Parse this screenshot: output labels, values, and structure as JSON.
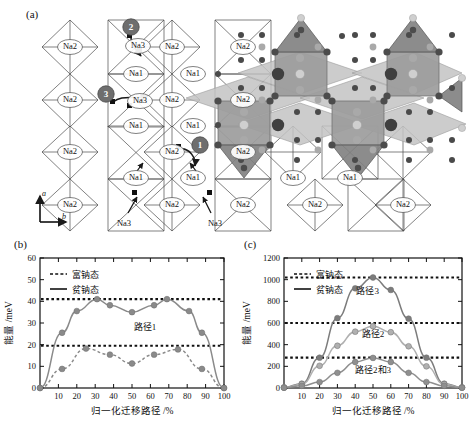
{
  "figure": {
    "panels": [
      {
        "id": "a",
        "label": "(a)"
      },
      {
        "id": "b",
        "label": "(b)"
      },
      {
        "id": "c",
        "label": "(c)"
      }
    ]
  },
  "panel_a": {
    "label": "(a)",
    "axis_a": "a",
    "axis_b": "b",
    "site_labels": [
      "Na1",
      "Na2",
      "Na3"
    ],
    "path_badges": [
      "1",
      "2",
      "3"
    ],
    "na3_callouts": [
      "Na3",
      "Na3"
    ],
    "sites": [
      {
        "name": "Na2",
        "x": 70,
        "y": 47
      },
      {
        "name": "Na3",
        "x": 138,
        "y": 46
      },
      {
        "name": "Na2",
        "x": 172,
        "y": 47
      },
      {
        "name": "Na2",
        "x": 243,
        "y": 47
      },
      {
        "name": "Na1",
        "x": 136,
        "y": 74
      },
      {
        "name": "Na1",
        "x": 193,
        "y": 74
      },
      {
        "name": "Na2",
        "x": 70,
        "y": 100
      },
      {
        "name": "Na3",
        "x": 140,
        "y": 101
      },
      {
        "name": "Na2",
        "x": 172,
        "y": 100
      },
      {
        "name": "Na2",
        "x": 243,
        "y": 100
      },
      {
        "name": "Na1",
        "x": 136,
        "y": 126
      },
      {
        "name": "Na1",
        "x": 193,
        "y": 126
      },
      {
        "name": "Na2",
        "x": 70,
        "y": 152
      },
      {
        "name": "Na2",
        "x": 172,
        "y": 152
      },
      {
        "name": "Na2",
        "x": 243,
        "y": 152
      },
      {
        "name": "Na1",
        "x": 136,
        "y": 178
      },
      {
        "name": "Na1",
        "x": 193,
        "y": 178
      },
      {
        "name": "Na2",
        "x": 70,
        "y": 205
      },
      {
        "name": "Na2",
        "x": 172,
        "y": 205
      },
      {
        "name": "Na2",
        "x": 243,
        "y": 205
      },
      {
        "name": "Na1",
        "x": 293,
        "y": 178
      },
      {
        "name": "Na1",
        "x": 350,
        "y": 178
      },
      {
        "name": "Na2",
        "x": 315,
        "y": 205
      },
      {
        "name": "Na2",
        "x": 403,
        "y": 205
      }
    ],
    "colors": {
      "outline": "#4a4a4a",
      "badge": "#6e6e6e",
      "poly_dark": "#6b6b6b",
      "poly_light": "#b9b9b9",
      "atom_dark": "#454545",
      "atom_mid": "#8d8d8d",
      "atom_light": "#cfcfcf"
    }
  },
  "chart_data": [
    {
      "panel": "b",
      "label": "(b)",
      "type": "line",
      "title": "",
      "xlabel": "归一化迁移路径 /%",
      "ylabel": "能量 /meV",
      "xlim": [
        0,
        100
      ],
      "ylim": [
        0,
        60
      ],
      "xticks": [
        10,
        20,
        30,
        40,
        50,
        60,
        70,
        80,
        90,
        100
      ],
      "yticks": [
        0,
        10,
        20,
        30,
        40,
        50,
        60
      ],
      "grid": false,
      "legend": [
        {
          "label": "富钠态",
          "style": "dashed"
        },
        {
          "label": "贫钠态",
          "style": "solid"
        }
      ],
      "annotations": [
        {
          "text": "路径1",
          "x": 57,
          "y": 27
        }
      ],
      "reference_lines": [
        {
          "value": 41.0,
          "style": "dotted",
          "for": "贫钠态"
        },
        {
          "value": 19.5,
          "style": "dotted",
          "for": "富钠态"
        }
      ],
      "series": [
        {
          "name": "贫钠态",
          "style": "solid",
          "color": "#8a8a8a",
          "x": [
            0,
            12,
            20,
            31,
            38,
            50,
            62,
            69,
            81,
            88,
            100
          ],
          "values": [
            0,
            25.5,
            35.5,
            41.0,
            38.2,
            35.0,
            38.2,
            41.0,
            35.5,
            25.5,
            0
          ]
        },
        {
          "name": "富钠态",
          "style": "dashed",
          "color": "#8a8a8a",
          "x": [
            0,
            12,
            25,
            38,
            50,
            62,
            75,
            88,
            100
          ],
          "values": [
            0,
            8.8,
            18.2,
            15.4,
            11.3,
            15.4,
            17.8,
            8.8,
            0
          ]
        }
      ]
    },
    {
      "panel": "c",
      "label": "(c)",
      "type": "line",
      "title": "",
      "xlabel": "归一化迁移路径 /%",
      "ylabel": "能量 /meV",
      "xlim": [
        0,
        100
      ],
      "ylim": [
        0,
        1200
      ],
      "xticks": [
        10,
        20,
        30,
        40,
        50,
        60,
        70,
        80,
        90,
        100
      ],
      "yticks": [
        0,
        200,
        400,
        600,
        800,
        1000,
        1200
      ],
      "grid": false,
      "legend": [
        {
          "label": "富钠态",
          "style": "dashed"
        },
        {
          "label": "贫钠态",
          "style": "solid"
        }
      ],
      "annotations": [
        {
          "text": "路径3",
          "x": 47,
          "y": 870
        },
        {
          "text": "路径2",
          "x": 50,
          "y": 470
        },
        {
          "text": "路径2和3",
          "x": 50,
          "y": 140
        }
      ],
      "reference_lines": [
        {
          "value": 1020,
          "style": "dotted",
          "for": "路径3"
        },
        {
          "value": 600,
          "style": "dotted",
          "for": "路径2"
        },
        {
          "value": 280,
          "style": "dotted",
          "for": "路径2和3"
        }
      ],
      "series": [
        {
          "name": "路径3",
          "style": "solid",
          "color": "#7c7c7c",
          "x": [
            0,
            10,
            20,
            30,
            40,
            50,
            60,
            70,
            80,
            90,
            100
          ],
          "values": [
            5,
            40,
            280,
            645,
            920,
            1020,
            905,
            640,
            280,
            40,
            5
          ]
        },
        {
          "name": "路径2",
          "style": "solid",
          "color": "#b0b0b0",
          "x": [
            0,
            10,
            20,
            30,
            40,
            50,
            60,
            70,
            80,
            90,
            100
          ],
          "values": [
            5,
            35,
            205,
            390,
            520,
            570,
            515,
            385,
            200,
            35,
            5
          ]
        },
        {
          "name": "路径2和3",
          "style": "solid",
          "color": "#8f8f8f",
          "x": [
            0,
            10,
            20,
            30,
            40,
            50,
            60,
            70,
            80,
            90,
            100
          ],
          "values": [
            2,
            20,
            55,
            140,
            240,
            278,
            240,
            140,
            55,
            20,
            2
          ]
        }
      ]
    }
  ]
}
